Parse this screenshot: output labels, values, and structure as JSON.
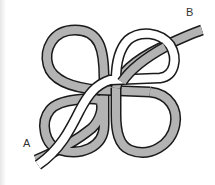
{
  "diagram": {
    "labels": {
      "end_a": "A",
      "end_b": "B"
    },
    "ropes": [
      {
        "name": "gray-rope",
        "fill": "#b3b3b3",
        "outline": "#1a1a1a"
      },
      {
        "name": "white-rope",
        "fill": "#ffffff",
        "outline": "#1a1a1a"
      }
    ],
    "colors": {
      "background": "#ffffff",
      "rope_gray": "#b3b3b3",
      "rope_white": "#ffffff",
      "outline": "#1a1a1a",
      "label_text": "#333333"
    }
  }
}
